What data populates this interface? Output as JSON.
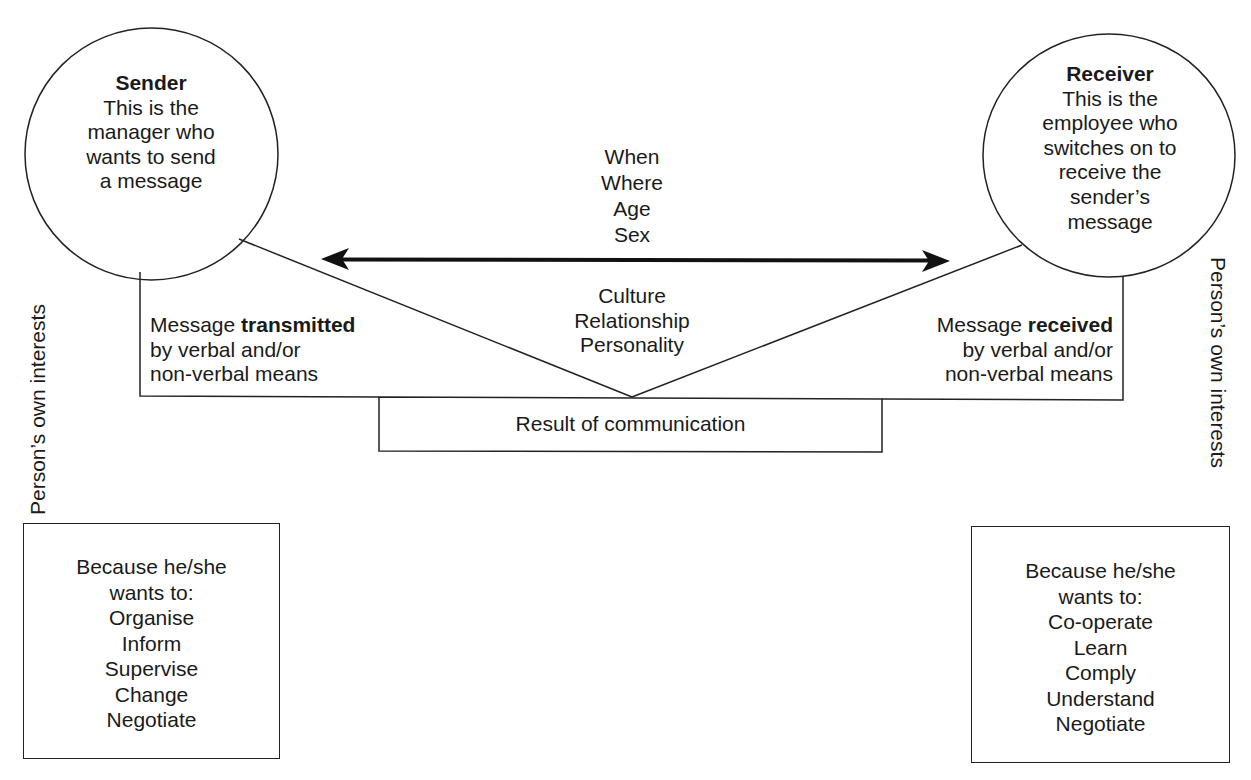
{
  "sender": {
    "title": "Sender",
    "lines": [
      "This is the",
      "manager who",
      "wants to send",
      "a message"
    ]
  },
  "receiver": {
    "title": "Receiver",
    "lines": [
      "This is the",
      "employee who",
      "switches on to",
      "receive the",
      "sender’s",
      "message"
    ]
  },
  "context_top": [
    "When",
    "Where",
    "Age",
    "Sex"
  ],
  "context_bottom": [
    "Culture",
    "Relationship",
    "Personality"
  ],
  "transmitted": {
    "prefix": "Message ",
    "emphasis": "transmitted",
    "lines": [
      "by verbal and/or",
      "non-verbal means"
    ]
  },
  "received": {
    "prefix": "Message ",
    "emphasis": "received",
    "lines": [
      "by verbal and/or",
      "non-verbal means"
    ]
  },
  "result": "Result of communication",
  "side_label_left": "Person’s own interests",
  "side_label_right": "Person’s own interests",
  "sender_interests": {
    "heading": [
      "Because he/she",
      "wants to:"
    ],
    "items": [
      "Organise",
      "Inform",
      "Supervise",
      "Change",
      "Negotiate"
    ]
  },
  "receiver_interests": {
    "heading": [
      "Because he/she",
      "wants to:"
    ],
    "items": [
      "Co-operate",
      "Learn",
      "Comply",
      "Understand",
      "Negotiate"
    ]
  },
  "colors": {
    "stroke": "#222222",
    "text": "#1a1a1a",
    "background": "#ffffff"
  }
}
